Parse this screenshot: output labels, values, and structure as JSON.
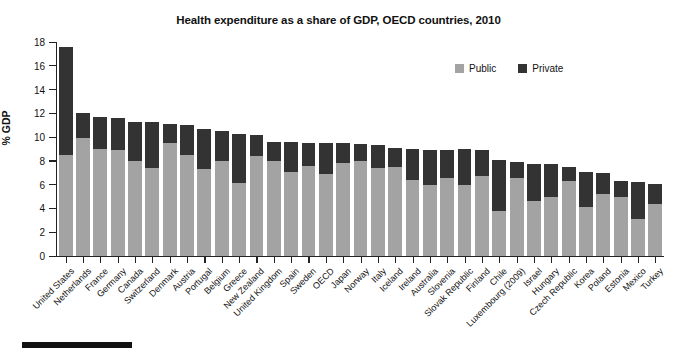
{
  "chart_data": {
    "type": "bar",
    "stacked": true,
    "title": "Health expenditure as a share of GDP, OECD countries, 2010",
    "xlabel": "",
    "ylabel": "% GDP",
    "ylim": [
      0,
      18
    ],
    "ytick_step": 2,
    "yticks": [
      0,
      2,
      4,
      6,
      8,
      10,
      12,
      14,
      16,
      18
    ],
    "grid": false,
    "legend_position": "top-right",
    "colors": {
      "public": "#a3a3a3",
      "private": "#333333",
      "axis": "#222222",
      "text": "#111111",
      "background": "#ffffff"
    },
    "categories": [
      "United States",
      "Netherlands",
      "France",
      "Germany",
      "Canada",
      "Switzerland",
      "Denmark",
      "Austria",
      "Portugal",
      "Belgium",
      "Greece",
      "New Zealand",
      "United Kingdom",
      "Spain",
      "Sweden",
      "OECD",
      "Japan",
      "Norway",
      "Italy",
      "Iceland",
      "Ireland",
      "Australia",
      "Slovenia",
      "Slovak Republic",
      "Finland",
      "Chile",
      "Luxembourg (2009)",
      "Israel",
      "Hungary",
      "Czech Republic",
      "Korea",
      "Poland",
      "Estonia",
      "Mexico",
      "Turkey"
    ],
    "series": [
      {
        "name": "Public",
        "color": "#a3a3a3",
        "values": [
          8.5,
          9.9,
          9.0,
          8.9,
          8.0,
          7.4,
          9.5,
          8.5,
          7.3,
          8.0,
          6.1,
          8.4,
          8.0,
          7.1,
          7.6,
          6.9,
          7.8,
          8.0,
          7.4,
          7.5,
          6.4,
          6.0,
          6.6,
          6.0,
          6.7,
          3.8,
          6.6,
          4.6,
          5.0,
          6.3,
          4.1,
          5.2,
          5.0,
          3.1,
          4.4
        ]
      },
      {
        "name": "Private",
        "color": "#333333",
        "values": [
          9.1,
          2.1,
          2.7,
          2.7,
          3.3,
          3.9,
          1.6,
          2.5,
          3.4,
          2.5,
          4.2,
          1.8,
          1.6,
          2.5,
          1.9,
          2.6,
          1.7,
          1.4,
          1.9,
          1.6,
          2.6,
          2.9,
          2.3,
          3.0,
          2.2,
          4.3,
          1.3,
          3.1,
          2.7,
          1.2,
          3.0,
          1.8,
          1.3,
          3.1,
          1.7
        ]
      },
      {
        "name": "Total",
        "values": [
          17.6,
          12.0,
          11.7,
          11.6,
          11.3,
          11.3,
          11.1,
          11.0,
          10.7,
          10.5,
          10.3,
          10.2,
          9.6,
          9.6,
          9.5,
          9.5,
          9.5,
          9.4,
          9.3,
          9.1,
          9.0,
          8.9,
          8.9,
          9.0,
          8.9,
          8.1,
          7.9,
          7.7,
          7.7,
          7.5,
          7.1,
          7.0,
          6.3,
          6.2,
          6.1
        ]
      }
    ],
    "legend": [
      {
        "label": "Public",
        "color": "#a3a3a3"
      },
      {
        "label": "Private",
        "color": "#333333"
      }
    ]
  }
}
